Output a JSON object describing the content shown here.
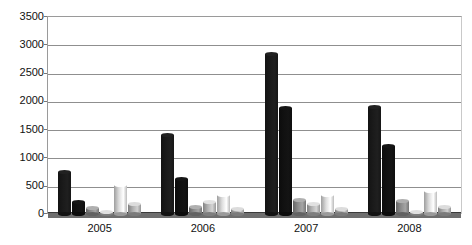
{
  "chart_data": {
    "type": "bar",
    "title": "",
    "xlabel": "",
    "ylabel": "",
    "grid": true,
    "legend": "none",
    "ylim": [
      0,
      3500
    ],
    "yticks": [
      0,
      500,
      1000,
      1500,
      2000,
      2500,
      3000,
      3500
    ],
    "categories": [
      "2005",
      "2006",
      "2007",
      "2008"
    ],
    "series": [
      {
        "name": "Series 1",
        "color": "#1a1a1a",
        "values": [
          750,
          1400,
          2830,
          1890
        ]
      },
      {
        "name": "Series 2",
        "color": "#111111",
        "values": [
          210,
          620,
          1870,
          1200
        ]
      },
      {
        "name": "Series 3",
        "color": "#8c8c8c",
        "values": [
          110,
          130,
          250,
          230
        ]
      },
      {
        "name": "Series 4",
        "color": "#b4b4b4",
        "values": [
          40,
          210,
          170,
          30
        ]
      },
      {
        "name": "Series 5",
        "color": "#dcdcdc",
        "values": [
          520,
          330,
          340,
          410
        ]
      },
      {
        "name": "Series 6",
        "color": "#b0b0b0",
        "values": [
          180,
          90,
          80,
          120
        ]
      }
    ]
  },
  "axis": {
    "y_tick_labels": [
      "3500",
      "3000",
      "2500",
      "2000",
      "1500",
      "1000",
      "500",
      "0"
    ],
    "x_tick_labels": [
      "2005",
      "2006",
      "2007",
      "2008"
    ]
  }
}
